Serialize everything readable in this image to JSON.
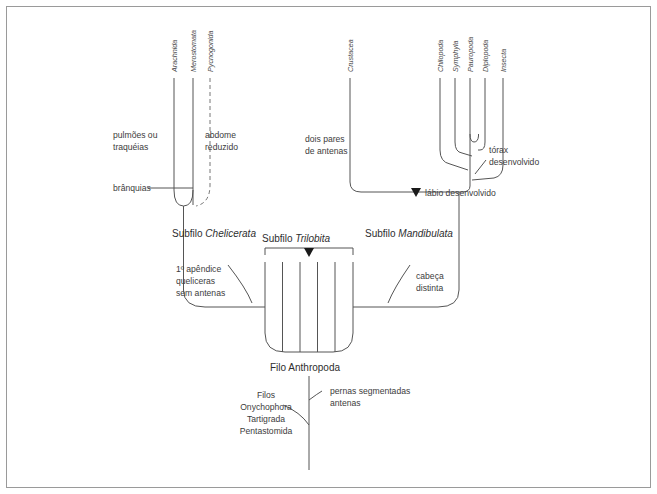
{
  "figure": {
    "kind": "cladogram",
    "language": "pt-BR",
    "frame_color": "#9a9a9a",
    "line_color": "#555555",
    "text_color": "#3a3a3a"
  },
  "taxa": {
    "chelicerata": [
      {
        "id": "arachnida",
        "label": "Arachnida"
      },
      {
        "id": "merostomata",
        "label": "Merostomata"
      },
      {
        "id": "pycnogonida",
        "label": "Pycnogonida"
      }
    ],
    "crustacea": [
      {
        "id": "crustacea",
        "label": "Crustacea"
      }
    ],
    "mandibulata": [
      {
        "id": "chilopoda",
        "label": "Chilopoda"
      },
      {
        "id": "symphyla",
        "label": "Symphyla"
      },
      {
        "id": "pauropoda",
        "label": "Pauropoda"
      },
      {
        "id": "diplopoda",
        "label": "Diplopoda"
      },
      {
        "id": "insecta",
        "label": "Insecta"
      }
    ]
  },
  "annotations": {
    "pulmoes_line1": "pulmões ou",
    "pulmoes_line2": "traquéias",
    "branquias": "brânquias",
    "abdome_line1": "abdome",
    "abdome_line2": "reduzido",
    "antenas_line1": "dois pares",
    "antenas_line2": "de antenas",
    "torax_line1": "tórax",
    "torax_line2": "desenvolvido",
    "labio": "lábio desenvolvido",
    "apendice_line1": "1º apêndice",
    "apendice_line2": "queliceras",
    "apendice_line3": "sem antenas",
    "cabeca_line1": "cabeça",
    "cabeca_line2": "distinta",
    "pernas_line1": "pernas segmentadas",
    "pernas_line2": "antenas"
  },
  "clades": {
    "chelicerata_prefix": "Subfilo ",
    "chelicerata_name": "Chelicerata",
    "trilobita_prefix": "Subfilo ",
    "trilobita_name": "Trilobita",
    "mandibulata_prefix": "Subfilo ",
    "mandibulata_name": "Mandibulata",
    "filo_prefix": "Filo ",
    "filo_name": "Anthropoda"
  },
  "outgroup": {
    "heading": "Filos",
    "items": [
      "Onychophora",
      "Tartigrada",
      "Pentastomida"
    ]
  }
}
